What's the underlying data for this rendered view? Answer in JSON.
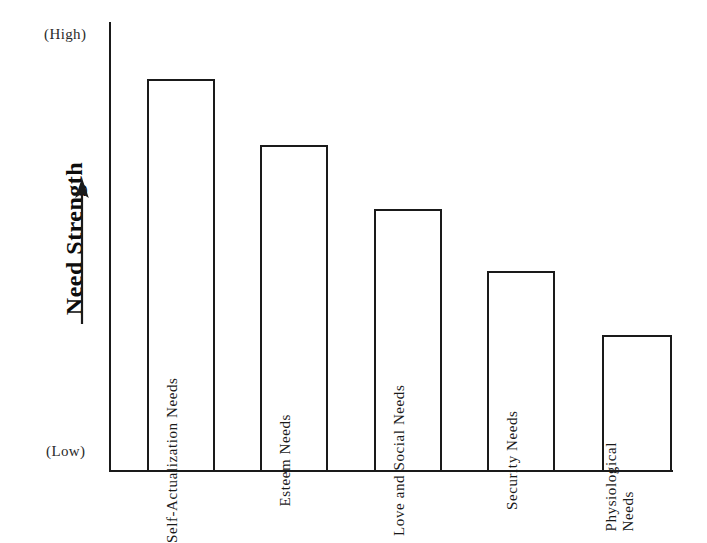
{
  "figure": {
    "y_axis_title": "Need Strength",
    "y_axis_high_label": "(High)",
    "y_axis_low_label": "(Low)",
    "arrow_icon": "up-arrow-icon"
  },
  "chart_data": {
    "type": "bar",
    "title": "",
    "xlabel": "",
    "ylabel": "Need Strength",
    "grid": false,
    "legend": null,
    "ylim": [
      0,
      100
    ],
    "y_tick_labels": [
      "(Low)",
      "(High)"
    ],
    "categories": [
      "Self-Actualization Needs",
      "Esteem Needs",
      "Love and Social Needs",
      "Security Needs",
      "Physiological Needs"
    ],
    "values": [
      87,
      72,
      58,
      44,
      30
    ]
  },
  "bars": [
    {
      "label": "Self-Actualization Needs",
      "label_lines": [
        "Self-Actualization Needs"
      ],
      "value": 87,
      "left": 147,
      "top": 79,
      "width": 68,
      "height": 393
    },
    {
      "label": "Esteem Needs",
      "label_lines": [
        "Esteem Needs"
      ],
      "value": 72,
      "left": 260,
      "top": 145,
      "width": 68,
      "height": 327
    },
    {
      "label": "Love and Social Needs",
      "label_lines": [
        "Love and Social Needs"
      ],
      "value": 58,
      "left": 374,
      "top": 209,
      "width": 68,
      "height": 263
    },
    {
      "label": "Security Needs",
      "label_lines": [
        "Security Needs"
      ],
      "value": 44,
      "left": 487,
      "top": 271,
      "width": 68,
      "height": 201
    },
    {
      "label": "Physiological Needs",
      "label_lines": [
        "Physiological",
        "Needs"
      ],
      "value": 30,
      "left": 602,
      "top": 335,
      "width": 70,
      "height": 137
    }
  ]
}
